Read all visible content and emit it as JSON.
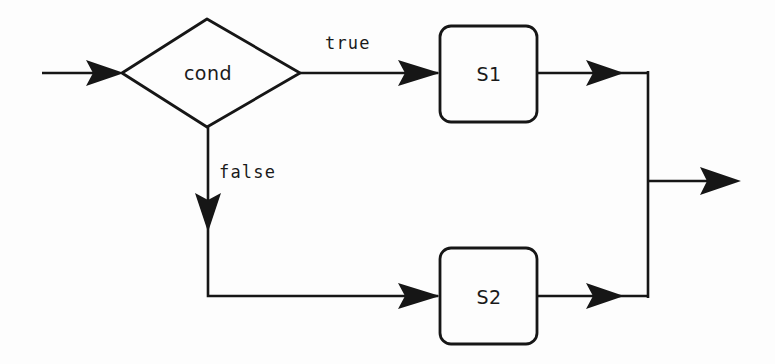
{
  "diagram": {
    "type": "flowchart",
    "background_color": "#fdfdfd",
    "stroke_color": "#161616",
    "nodes": {
      "decision": {
        "label": "cond",
        "shape": "diamond",
        "center_x": 207,
        "center_y": 73
      },
      "then_branch": {
        "label": "S1",
        "shape": "rounded-rectangle",
        "center_x": 488,
        "center_y": 73
      },
      "else_branch": {
        "label": "S2",
        "shape": "rounded-rectangle",
        "center_x": 488,
        "center_y": 296
      }
    },
    "edges": {
      "entry": {
        "label": ""
      },
      "true_branch": {
        "label": "true"
      },
      "false_branch": {
        "label": "false"
      },
      "then_merge": {
        "label": ""
      },
      "else_merge": {
        "label": ""
      },
      "exit": {
        "label": ""
      }
    }
  }
}
